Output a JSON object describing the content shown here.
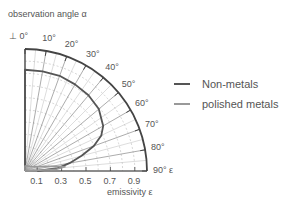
{
  "chart_data": {
    "type": "polar-line",
    "title": "",
    "angle_label": "observation angle α",
    "radial_label": "emissivity ε",
    "angle_ticks": [
      "0°",
      "10°",
      "20°",
      "30°",
      "40°",
      "50°",
      "60°",
      "70°",
      "80°",
      "90°"
    ],
    "radial_ticks": [
      "0.1",
      "0.3",
      "0.5",
      "0.7",
      "0.9"
    ],
    "radial_range": [
      0,
      1.0
    ],
    "angle_range_deg": [
      0,
      90
    ],
    "grid": true,
    "legend_position": "right",
    "series": [
      {
        "name": "Non-metals",
        "color": "#555555",
        "angles_deg": [
          0,
          10,
          20,
          30,
          40,
          50,
          60,
          65,
          70,
          75,
          80,
          85,
          90
        ],
        "values": [
          0.83,
          0.83,
          0.83,
          0.82,
          0.81,
          0.79,
          0.74,
          0.69,
          0.6,
          0.48,
          0.37,
          0.27,
          0.1
        ]
      },
      {
        "name": "polished metals",
        "color": "#999999",
        "angles_deg": [
          0,
          20,
          40,
          60,
          70,
          75,
          80,
          84,
          87,
          90
        ],
        "values": [
          0.04,
          0.045,
          0.05,
          0.07,
          0.1,
          0.14,
          0.22,
          0.33,
          0.25,
          0.0
        ]
      }
    ]
  },
  "labels": {
    "angle_title": "observation angle α",
    "radial_title": "emissivity ε",
    "zero_marker": "⊥"
  },
  "legend": {
    "items": [
      {
        "label": "Non-metals",
        "color": "#555555"
      },
      {
        "label": "polished metals",
        "color": "#999999"
      }
    ]
  }
}
